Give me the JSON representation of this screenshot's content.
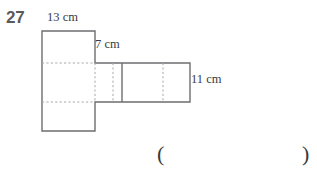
{
  "page": {
    "background_color": "#ffffff",
    "question_number": "27"
  },
  "figure": {
    "type": "net-of-rectangular-prism",
    "stroke_color": "#6e6e70",
    "fold_line_color": "#a9a9ab",
    "labels": [
      {
        "id": "label-13cm",
        "text": "13 cm",
        "edge": "top-edge-of-upper-left-face"
      },
      {
        "id": "label-7cm",
        "text": "7 cm",
        "edge": "right-edge-of-upper-left-face"
      },
      {
        "id": "label-11cm",
        "text": "11 cm",
        "edge": "right-edge-of-horizontal-band"
      }
    ],
    "geometry": {
      "column": {
        "x": 42,
        "y": 31,
        "width": 53,
        "height": 100
      },
      "band": {
        "x": 42,
        "y": 63,
        "width": 148,
        "height": 39
      },
      "column_fold_y": [
        63,
        102
      ],
      "band_fold_x": [
        95,
        113,
        163
      ],
      "band_solid_x": [
        122
      ]
    }
  },
  "answer_field": {
    "open_paren": "(",
    "close_paren": ")"
  }
}
